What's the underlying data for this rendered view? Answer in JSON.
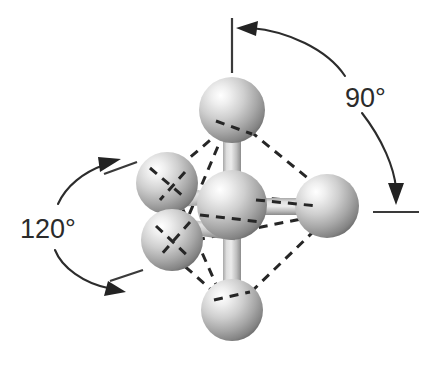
{
  "figure": {
    "background_color": "#ffffff",
    "annotations": [
      {
        "id": "angle-90",
        "label": "90°",
        "value": 90,
        "unit": "degrees",
        "position": "right",
        "label_x": 352,
        "label_y": 98,
        "describes": "angle between the axial (vertical) bond and the equatorial (horizontal) bond",
        "arc_color": "#2c2c2c"
      },
      {
        "id": "angle-120",
        "label": "120°",
        "value": 120,
        "unit": "degrees",
        "position": "left",
        "label_x": 22,
        "label_y": 228,
        "describes": "angle between two adjacent equatorial bonds",
        "arc_color": "#2c2c2c"
      }
    ],
    "reference_lines": [
      {
        "id": "vertical-axis-reference",
        "x1": 232,
        "y1": 18,
        "x2": 232,
        "y2": 72
      },
      {
        "id": "horizontal-axis-reference",
        "x1": 373,
        "y1": 212,
        "x2": 418,
        "y2": 212
      },
      {
        "id": "upper-equatorial-tick",
        "x1": 104,
        "y1": 173,
        "x2": 135,
        "y2": 162
      },
      {
        "id": "lower-equatorial-tick",
        "x1": 108,
        "y1": 279,
        "x2": 140,
        "y2": 270
      }
    ],
    "atoms": [
      {
        "id": "atom-center",
        "label": "central atom",
        "cx": 232,
        "cy": 205,
        "r": 35,
        "z": 5
      },
      {
        "id": "atom-axial-top",
        "label": "top axial atom",
        "cx": 232,
        "cy": 110,
        "r": 33,
        "z": 3
      },
      {
        "id": "atom-axial-bottom",
        "label": "bottom axial atom",
        "cx": 232,
        "cy": 310,
        "r": 31,
        "z": 2
      },
      {
        "id": "atom-equatorial-right",
        "label": "right equatorial atom",
        "cx": 327,
        "cy": 206,
        "r": 32,
        "z": 4
      },
      {
        "id": "atom-equatorial-upper-left",
        "label": "upper-left equatorial atom",
        "cx": 167,
        "cy": 183,
        "r": 31,
        "z": 6
      },
      {
        "id": "atom-equatorial-lower-left",
        "label": "lower-left equatorial atom",
        "cx": 172,
        "cy": 240,
        "r": 31,
        "z": 7
      }
    ],
    "bonds": [
      {
        "id": "bond-center-top",
        "from": "atom-center",
        "to": "atom-axial-top",
        "style": "cylinder"
      },
      {
        "id": "bond-center-bottom",
        "from": "atom-center",
        "to": "atom-axial-bottom",
        "style": "cylinder"
      },
      {
        "id": "bond-center-right",
        "from": "atom-center",
        "to": "atom-equatorial-right",
        "style": "cylinder"
      },
      {
        "id": "bond-center-upper-left",
        "from": "atom-center",
        "to": "atom-equatorial-upper-left",
        "style": "cylinder-short"
      },
      {
        "id": "bond-center-lower-left",
        "from": "atom-center",
        "to": "atom-equatorial-lower-left",
        "style": "cylinder-short"
      }
    ],
    "wireframe": {
      "id": "octahedron-wireframe",
      "style": "dashed",
      "color": "#262626",
      "edges": [
        {
          "from": "atom-axial-top",
          "to": "atom-equatorial-upper-left"
        },
        {
          "from": "atom-axial-top",
          "to": "atom-equatorial-lower-left"
        },
        {
          "from": "atom-axial-top",
          "to": "atom-equatorial-right"
        },
        {
          "from": "atom-axial-bottom",
          "to": "atom-equatorial-upper-left"
        },
        {
          "from": "atom-axial-bottom",
          "to": "atom-equatorial-lower-left"
        },
        {
          "from": "atom-axial-bottom",
          "to": "atom-equatorial-right"
        },
        {
          "from": "atom-equatorial-upper-left",
          "to": "atom-equatorial-right"
        },
        {
          "from": "atom-equatorial-lower-left",
          "to": "atom-equatorial-right"
        },
        {
          "from": "atom-equatorial-upper-left",
          "to": "atom-equatorial-lower-left"
        }
      ]
    },
    "colors": {
      "sphere_highlight": "#ffffff",
      "sphere_mid": "#c9c9c9",
      "sphere_shadow": "#6e6e6e",
      "bond_light": "#e3e3e3",
      "bond_mid": "#bdbdbd",
      "bond_dark": "#8a8a8a",
      "line_color": "#2c2c2c",
      "text_color": "#2b2b2b"
    }
  }
}
